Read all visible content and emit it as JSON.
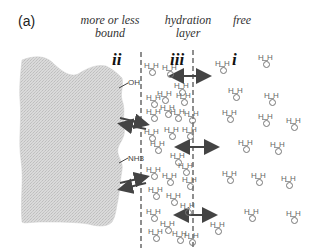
{
  "figure": {
    "panel_label": "(a)",
    "regions": [
      {
        "id": "bound",
        "title_line1": "more or less",
        "title_line2": "bound",
        "roman": "ii"
      },
      {
        "id": "hydration",
        "title_line1": "hydration",
        "title_line2": "layer",
        "roman": "iii"
      },
      {
        "id": "free",
        "title_line1": "free",
        "title_line2": "",
        "roman": "i"
      }
    ],
    "surface_groups": [
      "OH",
      "NH3"
    ],
    "molecule": {
      "h": "H",
      "o": "O"
    },
    "colors": {
      "protein_fill": "#d9d9d9",
      "protein_texture": "#c4c4c4",
      "arrow": "#444444",
      "dash_line": "#444444",
      "molecule_text": "#666666"
    }
  }
}
